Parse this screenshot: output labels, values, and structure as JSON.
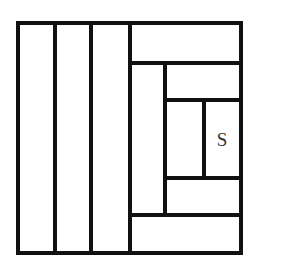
{
  "diagram": {
    "type": "log-cabin quilt block / nested rectangle partition",
    "stroke_color": "#111111",
    "background": "#ffffff",
    "outer_square": {
      "x1": 18,
      "y1": 23,
      "x2": 241,
      "y2": 253
    },
    "segments": [
      {
        "id": "outer-top",
        "x1": 18,
        "y1": 23,
        "x2": 241,
        "y2": 23
      },
      {
        "id": "outer-bottom",
        "x1": 18,
        "y1": 253,
        "x2": 241,
        "y2": 253
      },
      {
        "id": "outer-left",
        "x1": 18,
        "y1": 23,
        "x2": 18,
        "y2": 253
      },
      {
        "id": "outer-right",
        "x1": 241,
        "y1": 23,
        "x2": 241,
        "y2": 253
      },
      {
        "id": "strip-divider-1",
        "x1": 55,
        "y1": 23,
        "x2": 55,
        "y2": 253
      },
      {
        "id": "strip-divider-2",
        "x1": 91,
        "y1": 23,
        "x2": 91,
        "y2": 253
      },
      {
        "id": "strip-divider-3",
        "x1": 130,
        "y1": 23,
        "x2": 130,
        "y2": 253
      },
      {
        "id": "top-band",
        "x1": 130,
        "y1": 63,
        "x2": 241,
        "y2": 63
      },
      {
        "id": "bottom-band",
        "x1": 130,
        "y1": 215,
        "x2": 241,
        "y2": 215
      },
      {
        "id": "inner-left",
        "x1": 165,
        "y1": 63,
        "x2": 165,
        "y2": 215
      },
      {
        "id": "inner-top",
        "x1": 165,
        "y1": 100,
        "x2": 241,
        "y2": 100
      },
      {
        "id": "inner-bottom",
        "x1": 165,
        "y1": 178,
        "x2": 241,
        "y2": 178
      },
      {
        "id": "center-divider",
        "x1": 204,
        "y1": 100,
        "x2": 204,
        "y2": 178
      }
    ],
    "labels": [
      {
        "id": "s-label",
        "text": "S",
        "x": 222,
        "y": 146
      }
    ]
  }
}
